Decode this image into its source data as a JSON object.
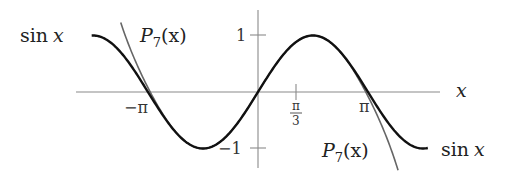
{
  "diagram": {
    "title": "",
    "x_axis_label": "x",
    "y_tick_labels": {
      "pos": "1",
      "neg": "−1"
    },
    "x_tick_labels": {
      "neg_pi": "−π",
      "pi": "π",
      "pi_over_3_num": "π",
      "pi_over_3_den": "3"
    },
    "curve_labels": {
      "sin_left": {
        "fn": "sin",
        "var": "x"
      },
      "sin_right": {
        "fn": "sin",
        "var": "x"
      },
      "p7_left": {
        "name": "P",
        "sub": "7",
        "arg": "(x)"
      },
      "p7_right": {
        "name": "P",
        "sub": "7",
        "arg": "(x)"
      }
    },
    "colors": {
      "sin_curve": "#111111",
      "p7_curve": "#666666",
      "axes": "#8a8a8a",
      "text": "#222222"
    }
  },
  "chart_data": {
    "type": "line",
    "xlabel": "x",
    "ylabel": "",
    "xlim": [
      -4.75,
      4.85
    ],
    "ylim": [
      -1.35,
      1.35
    ],
    "x_ticks": [
      {
        "value": -3.14159,
        "label": "−π"
      },
      {
        "value": 1.0472,
        "label": "π/3"
      },
      {
        "value": 3.14159,
        "label": "π"
      }
    ],
    "y_ticks": [
      {
        "value": 1,
        "label": "1"
      },
      {
        "value": -1,
        "label": "−1"
      }
    ],
    "grid": false,
    "series": [
      {
        "name": "sin x",
        "expr": "sin(x)",
        "domain": [
          -4.75,
          4.85
        ]
      },
      {
        "name": "P7(x)",
        "expr": "x - x^3/6 + x^5/120 - x^7/5040",
        "domain": [
          -3.92,
          4.0
        ]
      }
    ]
  }
}
